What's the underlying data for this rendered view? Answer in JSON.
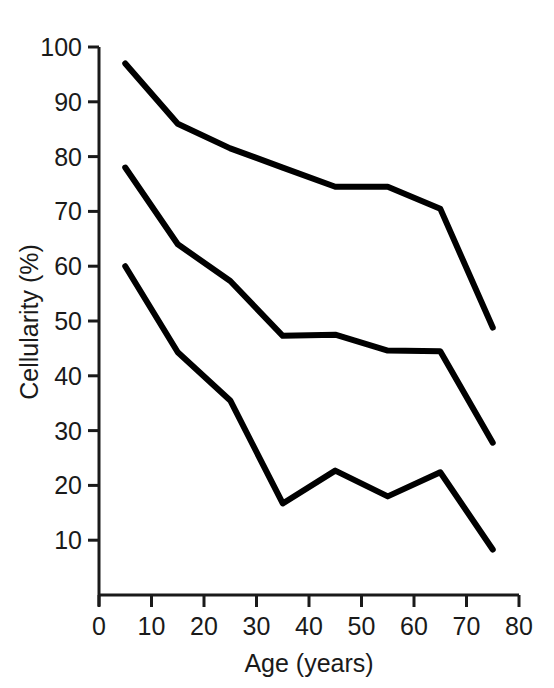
{
  "chart_data": {
    "type": "line",
    "title": "",
    "subtitle": "",
    "xlabel": "Age (years)",
    "ylabel": "Cellularity (%)",
    "xlim": [
      0,
      80
    ],
    "ylim": [
      0,
      100
    ],
    "xticks": [
      0,
      10,
      20,
      30,
      40,
      50,
      60,
      70,
      80
    ],
    "xtick_labels": [
      "0",
      "10",
      "20",
      "30",
      "40",
      "50",
      "60",
      "70",
      "80"
    ],
    "yticks": [
      10,
      20,
      30,
      40,
      50,
      60,
      70,
      80,
      90,
      100
    ],
    "ytick_labels": [
      "10",
      "20",
      "30",
      "40",
      "50",
      "60",
      "70",
      "80",
      "90",
      "100"
    ],
    "grid": false,
    "legend": "none",
    "line_color": "#000000",
    "x": [
      5,
      15,
      25,
      35,
      45,
      55,
      65,
      75
    ],
    "series": [
      {
        "name": "upper",
        "values": [
          97,
          86,
          81.5,
          78,
          74.5,
          74.5,
          70.5,
          48.8
        ]
      },
      {
        "name": "median",
        "values": [
          78,
          64,
          57.3,
          47.3,
          47.5,
          44.6,
          44.5,
          27.8
        ]
      },
      {
        "name": "lower",
        "values": [
          60,
          44.3,
          35.5,
          16.7,
          22.7,
          18,
          22.4,
          8.3
        ]
      }
    ]
  },
  "figure": {
    "background_color": "#ffffff",
    "text_color": "#1a1a1a"
  }
}
